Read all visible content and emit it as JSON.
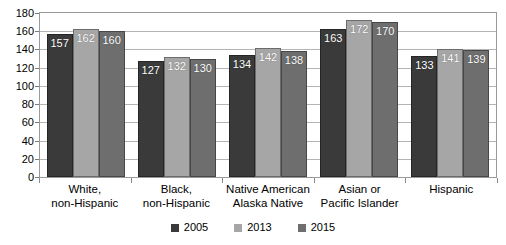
{
  "chart_data": {
    "type": "bar",
    "title": "",
    "xlabel": "",
    "ylabel": "",
    "ylim": [
      0,
      180
    ],
    "ytick_step": 20,
    "yticks": [
      180,
      160,
      140,
      120,
      100,
      80,
      60,
      40,
      20,
      0
    ],
    "grid": true,
    "legend_position": "bottom",
    "categories": [
      "White,\nnon-Hispanic",
      "Black,\nnon-Hispanic",
      "Native American\nAlaska Native",
      "Asian or\nPacific Islander",
      "Hispanic"
    ],
    "category_lines": [
      [
        "White,",
        "non-Hispanic"
      ],
      [
        "Black,",
        "non-Hispanic"
      ],
      [
        "Native American",
        "Alaska Native"
      ],
      [
        "Asian or",
        "Pacific Islander"
      ],
      [
        "Hispanic",
        ""
      ]
    ],
    "series": [
      {
        "name": "2005",
        "color": "#3a3a3a",
        "values": [
          157,
          127,
          134,
          163,
          133
        ]
      },
      {
        "name": "2013",
        "color": "#a6a6a6",
        "values": [
          162,
          132,
          142,
          172,
          141
        ]
      },
      {
        "name": "2015",
        "color": "#6e6e6e",
        "values": [
          160,
          130,
          138,
          170,
          139
        ]
      }
    ]
  },
  "legend": {
    "items": [
      {
        "label": "2005",
        "color": "#3a3a3a"
      },
      {
        "label": "2013",
        "color": "#a6a6a6"
      },
      {
        "label": "2015",
        "color": "#6e6e6e"
      }
    ]
  },
  "colors": {
    "background": "#ffffff",
    "gridline": "#b4b4b4",
    "axis": "#9a9a9a",
    "text": "#000000",
    "data_label": "#ffffff"
  }
}
